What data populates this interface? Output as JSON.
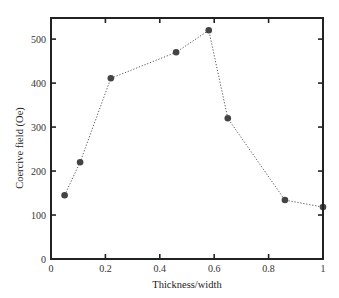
{
  "chart_data": {
    "type": "line",
    "title": "",
    "xlabel": "Thickness/width",
    "ylabel": "Coercive field (Oe)",
    "xlim": [
      0,
      1
    ],
    "ylim": [
      0,
      548
    ],
    "x_ticks": [
      0,
      0.2,
      0.4,
      0.6,
      0.8,
      1
    ],
    "x_tick_labels": [
      "0",
      "0.2",
      "0.4",
      "0.6",
      "0.8",
      "1"
    ],
    "y_ticks": [
      0,
      100,
      200,
      300,
      400,
      500
    ],
    "y_tick_labels": [
      "0",
      "100",
      "200",
      "300",
      "400",
      "500"
    ],
    "grid": false,
    "legend": null,
    "series": [
      {
        "name": "Coercive field",
        "marker": "circle",
        "line_style": "dotted",
        "color": "#444444",
        "x": [
          0.05,
          0.107,
          0.22,
          0.46,
          0.58,
          0.65,
          0.86,
          1.0
        ],
        "values": [
          145,
          220,
          411,
          470,
          520,
          320,
          134,
          118
        ]
      }
    ]
  }
}
